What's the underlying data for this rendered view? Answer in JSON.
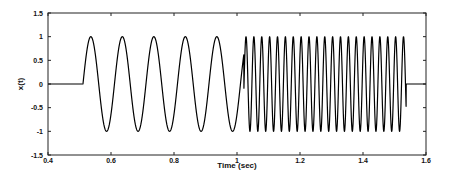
{
  "chart_data": {
    "type": "line",
    "title": "",
    "xlabel": "Time (sec)",
    "ylabel": "x(t)",
    "xlim": [
      0.4,
      1.6
    ],
    "ylim": [
      -1.5,
      1.5
    ],
    "x_ticks": [
      "0.4",
      "0.6",
      "0.8",
      "1",
      "1.2",
      "1.4",
      "1.6"
    ],
    "x_tick_values": [
      0.4,
      0.6,
      0.8,
      1.0,
      1.2,
      1.4,
      1.6
    ],
    "y_ticks": [
      "1.5",
      "1",
      "0.5",
      "0",
      "-0.5",
      "-1",
      "-1.5"
    ],
    "y_tick_values": [
      1.5,
      1,
      0.5,
      0,
      -0.5,
      -1,
      -1.5
    ],
    "grid": false,
    "legend": null,
    "series": [
      {
        "name": "x(t)",
        "color": "#000000",
        "description": "Zero until ~0.51 s, 10 Hz unit-amplitude sinusoid until ~1.02 s, then 40 Hz unit-amplitude sinusoid until ~1.54 s, then zero",
        "segments": [
          {
            "type": "zero",
            "t_start": 0.4,
            "t_end": 0.511
          },
          {
            "type": "sine",
            "t_start": 0.511,
            "t_end": 1.022,
            "freq_hz": 10,
            "amplitude": 1,
            "phase_ref": 0.511
          },
          {
            "type": "sine",
            "t_start": 1.022,
            "t_end": 1.537,
            "freq_hz": 40,
            "amplitude": 1,
            "peak_at": 1.0286
          },
          {
            "type": "zero",
            "t_start": 1.537,
            "t_end": 1.6
          }
        ]
      }
    ]
  }
}
